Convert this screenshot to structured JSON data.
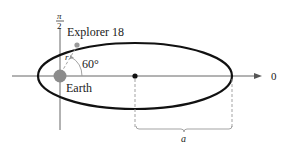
{
  "figure": {
    "labels": {
      "polar_axis_zero": "0",
      "pi_over_2_numerator": "π",
      "pi_over_2_denominator": "2",
      "satellite": "Explorer 18",
      "planet": "Earth",
      "angle": "60°",
      "radius": "r",
      "semi_major_axis": "a"
    },
    "colors": {
      "orbit": "#111111",
      "axes": "#555555",
      "earth": "#8c8c8c",
      "satellite": "#9a9a9a",
      "dashed": "#9a9a9a",
      "text": "#1a1a1a"
    }
  }
}
